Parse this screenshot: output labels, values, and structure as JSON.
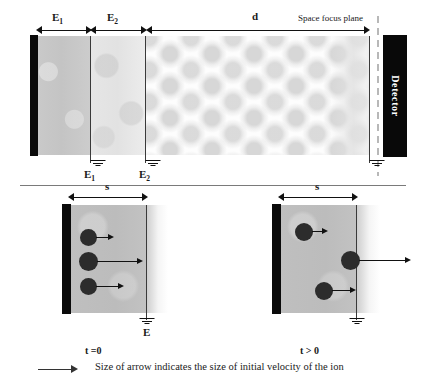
{
  "figure": {
    "type": "schematic"
  },
  "top_panel": {
    "regions": [
      {
        "id": "e1",
        "label": "E",
        "subscript": "1",
        "description": "first acceleration region",
        "fill": "#c6c6c6"
      },
      {
        "id": "e2",
        "label": "E",
        "subscript": "2",
        "description": "second acceleration region",
        "fill": "#e6e6e6"
      },
      {
        "id": "d",
        "label": "d",
        "subscript": "",
        "description": "field-free drift region",
        "fill": "#fdfdfd"
      }
    ],
    "dimension_labels": [
      {
        "name": "E1",
        "text": "E",
        "sub": "1"
      },
      {
        "name": "E2",
        "text": "E",
        "sub": "2"
      },
      {
        "name": "d",
        "text": "d",
        "sub": ""
      }
    ],
    "electrode_labels": [
      {
        "name": "E1-ground",
        "text": "E",
        "sub": "1"
      },
      {
        "name": "E2-ground",
        "text": "E",
        "sub": "2"
      }
    ],
    "space_focus_plane_label": "Space focus plane",
    "detector_label": "Detector",
    "repeller_plate": "repeller-plate"
  },
  "bottom_left_panel": {
    "dimension_label": "s",
    "time_label": "t =0",
    "field_label": "E",
    "ion_count": 3,
    "ions": [
      {
        "id": "ion-1",
        "velocity": "small",
        "arrow_length": 18
      },
      {
        "id": "ion-2",
        "velocity": "large",
        "arrow_length": 46
      },
      {
        "id": "ion-3",
        "velocity": "medium",
        "arrow_length": 28
      }
    ]
  },
  "bottom_right_panel": {
    "dimension_label": "s",
    "time_label": "t > 0",
    "ion_count": 3,
    "ions": [
      {
        "id": "ion-1",
        "velocity": "small",
        "arrow_length": 16
      },
      {
        "id": "ion-2",
        "velocity": "large",
        "arrow_length": 52
      },
      {
        "id": "ion-3",
        "velocity": "medium",
        "arrow_length": 24
      }
    ]
  },
  "caption": {
    "text": "Size of arrow indicates the size of initial velocity of the ion",
    "arrow_icon": "right-arrow-icon"
  },
  "colors": {
    "ink": "#1a1a1a",
    "plate": "#0a0a0a",
    "ion": "#2c2c2c",
    "grid_line": "#3a3a3a",
    "divider": "#7a7a7a",
    "dashed_plane": "#b8b8b8"
  }
}
